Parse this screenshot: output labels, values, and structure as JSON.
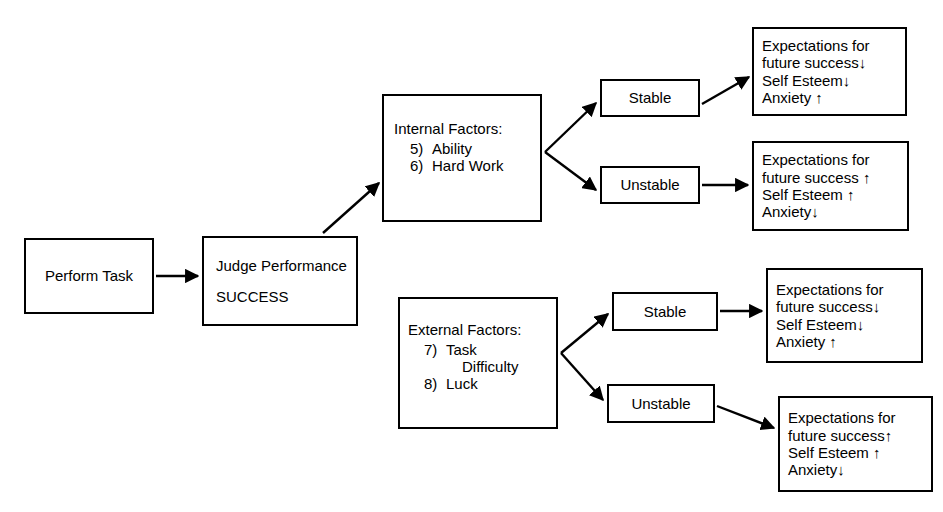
{
  "diagram": {
    "stroke_color": "#000000",
    "background_color": "#ffffff",
    "nodes": {
      "perform_task": {
        "label": "Perform Task"
      },
      "judge_performance": {
        "label": "Judge Performance",
        "outcome": "SUCCESS"
      },
      "internal_factors": {
        "title": "Internal Factors:",
        "items": [
          {
            "num": "5)",
            "text": "Ability"
          },
          {
            "num": "6)",
            "text": "Hard Work"
          }
        ]
      },
      "external_factors": {
        "title": "External Factors:",
        "items": [
          {
            "num": "7)",
            "text": "Task",
            "cont": "Difficulty"
          },
          {
            "num": "8)",
            "text": "Luck"
          }
        ]
      },
      "stable_internal": {
        "label": "Stable"
      },
      "unstable_internal": {
        "label": "Unstable"
      },
      "stable_external": {
        "label": "Stable"
      },
      "unstable_external": {
        "label": "Unstable"
      },
      "outcome_1": {
        "line1": "Expectations for",
        "line2": "future success↓",
        "line3": "Self Esteem↓",
        "line4": "Anxiety ↑"
      },
      "outcome_2": {
        "line1": "Expectations for",
        "line2": "future success ↑",
        "line3": "Self Esteem ↑",
        "line4": "Anxiety↓"
      },
      "outcome_3": {
        "line1": "Expectations for",
        "line2": "future success↓",
        "line3": "Self Esteem↓",
        "line4": "Anxiety ↑"
      },
      "outcome_4": {
        "line1": "Expectations for",
        "line2": "future success↑",
        "line3": "Self Esteem ↑",
        "line4": "Anxiety↓"
      }
    },
    "edges": [
      {
        "name": "perform-task-to-judge-performance",
        "from": "perform_task",
        "to": "judge_performance"
      },
      {
        "name": "judge-performance-to-internal-factors",
        "from": "judge_performance",
        "to": "internal_factors"
      },
      {
        "name": "internal-factors-to-stable",
        "from": "internal_factors",
        "to": "stable_internal"
      },
      {
        "name": "internal-factors-to-unstable",
        "from": "internal_factors",
        "to": "unstable_internal"
      },
      {
        "name": "stable-internal-to-outcome-1",
        "from": "stable_internal",
        "to": "outcome_1"
      },
      {
        "name": "unstable-internal-to-outcome-2",
        "from": "unstable_internal",
        "to": "outcome_2"
      },
      {
        "name": "external-factors-to-stable",
        "from": "external_factors",
        "to": "stable_external"
      },
      {
        "name": "external-factors-to-unstable",
        "from": "external_factors",
        "to": "unstable_external"
      },
      {
        "name": "stable-external-to-outcome-3",
        "from": "stable_external",
        "to": "outcome_3"
      },
      {
        "name": "unstable-external-to-outcome-4",
        "from": "unstable_external",
        "to": "outcome_4"
      }
    ]
  }
}
